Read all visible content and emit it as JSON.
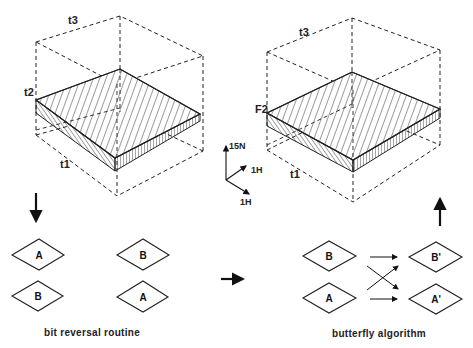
{
  "left_cube": {
    "axis_top": "t3",
    "axis_side": "t2",
    "axis_bottom": "t1"
  },
  "right_cube": {
    "axis_top": "t3",
    "axis_side": "F2",
    "axis_bottom": "t1"
  },
  "axes_legend": {
    "vertical": "15N",
    "diagonal_up": "1H",
    "diagonal_down": "1H"
  },
  "bit_reversal": {
    "caption": "bit reversal routine",
    "before": [
      "A",
      "B"
    ],
    "after": [
      "B",
      "A"
    ]
  },
  "butterfly": {
    "caption": "butterfly algorithm",
    "inputs": [
      "B",
      "A"
    ],
    "outputs": [
      "B'",
      "A'"
    ]
  }
}
